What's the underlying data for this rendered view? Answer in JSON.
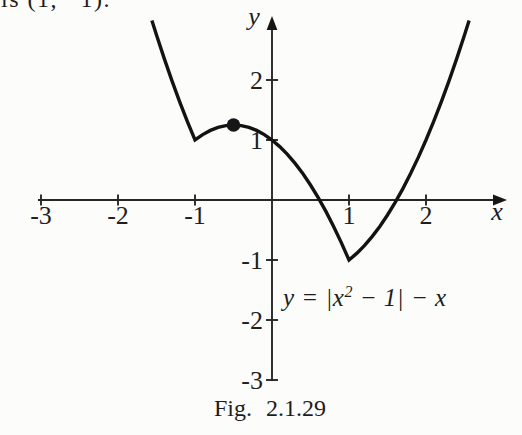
{
  "page": {
    "background": "#fcfcfa",
    "ink": "#1c1c1c",
    "curve_color": "#131313"
  },
  "top_text_fragment": "is (1, −1).",
  "equation": {
    "pre": "y = |x",
    "sup": "2",
    "post": " − 1| − x"
  },
  "caption": {
    "prefix": "Fig.",
    "number": "2.1.29"
  },
  "axes": {
    "x_label": "x",
    "y_label": "y"
  },
  "chart_data": {
    "type": "line",
    "title": "",
    "xlabel": "x",
    "ylabel": "y",
    "xlim": [
      -3.1,
      3.1
    ],
    "ylim": [
      -3.3,
      3.1
    ],
    "grid": false,
    "x_ticks": [
      -3,
      -2,
      -1,
      1,
      2
    ],
    "y_ticks": [
      2,
      1,
      -1,
      -2,
      -3
    ],
    "curve": {
      "expression": "y = |x^2 - 1| - x",
      "points": [
        [
          -1.56,
          2.994
        ],
        [
          -1.5,
          2.75
        ],
        [
          -1.4,
          2.36
        ],
        [
          -1.3,
          1.99
        ],
        [
          -1.2,
          1.64
        ],
        [
          -1.1,
          1.31
        ],
        [
          -1,
          1
        ],
        [
          -0.9,
          1.09
        ],
        [
          -0.8,
          1.16
        ],
        [
          -0.7,
          1.21
        ],
        [
          -0.6,
          1.24
        ],
        [
          -0.5,
          1.25
        ],
        [
          -0.4,
          1.24
        ],
        [
          -0.3,
          1.21
        ],
        [
          -0.2,
          1.16
        ],
        [
          -0.1,
          1.09
        ],
        [
          0,
          1
        ],
        [
          0.1,
          0.89
        ],
        [
          0.2,
          0.76
        ],
        [
          0.3,
          0.61
        ],
        [
          0.4,
          0.44
        ],
        [
          0.5,
          0.25
        ],
        [
          0.6,
          0.04
        ],
        [
          0.7,
          -0.19
        ],
        [
          0.8,
          -0.44
        ],
        [
          0.9,
          -0.71
        ],
        [
          1,
          -1
        ],
        [
          1.1,
          -0.89
        ],
        [
          1.2,
          -0.76
        ],
        [
          1.3,
          -0.61
        ],
        [
          1.4,
          -0.44
        ],
        [
          1.5,
          -0.25
        ],
        [
          1.6,
          -0.04
        ],
        [
          1.7,
          0.19
        ],
        [
          1.8,
          0.44
        ],
        [
          1.9,
          0.71
        ],
        [
          2,
          1
        ],
        [
          2.1,
          1.31
        ],
        [
          2.2,
          1.64
        ],
        [
          2.3,
          1.99
        ],
        [
          2.4,
          2.36
        ],
        [
          2.5,
          2.75
        ],
        [
          2.56,
          2.994
        ]
      ]
    },
    "marked_point": {
      "x": -0.5,
      "y": 1.25
    },
    "corner_points": [
      [
        -1,
        1
      ],
      [
        1,
        -1
      ]
    ]
  }
}
